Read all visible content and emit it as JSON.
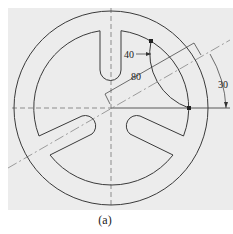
{
  "figure": {
    "caption": "(a)",
    "panel_color": "#ececec",
    "line_color": "#3a3a3a"
  },
  "dimensions": {
    "radius_label": "40",
    "length_label": "80",
    "angle_label": "30"
  },
  "geometry": {
    "center": [
      111,
      108
    ],
    "outer_radius": 97,
    "inner_radius": 78,
    "slot_count": 3,
    "slot_width": 20,
    "centerline_angle_deg": 30
  }
}
